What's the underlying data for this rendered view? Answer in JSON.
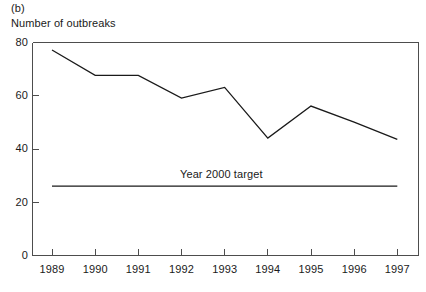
{
  "figure": {
    "panel_label": "(b)",
    "axis_title": "Number of outbreaks"
  },
  "chart_data": {
    "type": "line",
    "title": "",
    "subtitle": "",
    "xlabel": "",
    "ylabel": "Number of outbreaks",
    "categories": [
      "1989",
      "1990",
      "1991",
      "1992",
      "1993",
      "1994",
      "1995",
      "1996",
      "1997"
    ],
    "x": [
      1989,
      1990,
      1991,
      1992,
      1993,
      1994,
      1995,
      1996,
      1997
    ],
    "xlim": [
      1988.7,
      1997.5
    ],
    "ylim": [
      0,
      80
    ],
    "yticks": [
      0,
      20,
      40,
      60,
      80
    ],
    "ytick_labels": [
      "0",
      "20",
      "40",
      "60",
      "80"
    ],
    "xticks": [
      1989,
      1990,
      1991,
      1992,
      1993,
      1994,
      1995,
      1996,
      1997
    ],
    "xtick_labels": [
      "1989",
      "1990",
      "1991",
      "1992",
      "1993",
      "1994",
      "1995",
      "1996",
      "1997"
    ],
    "grid": false,
    "legend_position": "none",
    "series": [
      {
        "name": "Number of outbreaks",
        "type": "line",
        "color": "#1a1a1a",
        "values": [
          77,
          67.5,
          67.5,
          59,
          63,
          44,
          56,
          50,
          43.5
        ]
      },
      {
        "name": "Year 2000 target",
        "type": "line",
        "color": "#1a1a1a",
        "constant_value": 26,
        "values": [
          26,
          26,
          26,
          26,
          26,
          26,
          26,
          26,
          26
        ]
      }
    ],
    "annotations": [
      {
        "text": "Year 2000 target",
        "x": 1993,
        "y": 31
      }
    ]
  },
  "axes": {
    "y_tick_labels": [
      "80",
      "60",
      "40",
      "20",
      "0"
    ],
    "x_tick_labels": [
      "1989",
      "1990",
      "1991",
      "1992",
      "1993",
      "1994",
      "1995",
      "1996",
      "1997"
    ]
  },
  "colors": {
    "line": "#1a1a1a",
    "axis": "#4d4d4d",
    "background": "#ffffff"
  }
}
